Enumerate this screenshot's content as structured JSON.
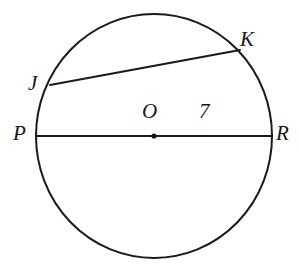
{
  "figure": {
    "kind": "circle-with-diameter-and-chord",
    "background_color": "#ffffff",
    "stroke_color": "#1a1a1e",
    "label_color": "#16161a",
    "circle": {
      "center_x": 154,
      "center_y": 136,
      "radius_x": 118,
      "radius_y": 122,
      "stroke_width": 2
    },
    "center_point": {
      "name": "O",
      "x": 154,
      "y": 136,
      "dot_radius": 2.6
    },
    "segments": [
      {
        "name": "diameter-PR",
        "from": "P",
        "to": "R",
        "x1": 36,
        "y1": 136,
        "x2": 272,
        "y2": 136,
        "stroke_width": 2
      },
      {
        "name": "chord-JK",
        "from": "J",
        "to": "K",
        "x1": 50,
        "y1": 85,
        "x2": 240,
        "y2": 50,
        "stroke_width": 2
      }
    ],
    "labels": {
      "P": "P",
      "R": "R",
      "J": "J",
      "K": "K",
      "O": "O",
      "measure_OR": "7"
    }
  }
}
